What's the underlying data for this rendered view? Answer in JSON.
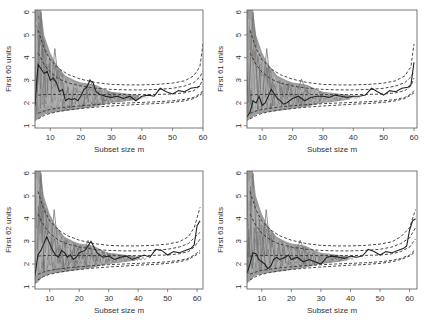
{
  "figure": {
    "width": 425,
    "height": 326,
    "layout": "2x2"
  },
  "colors": {
    "frame": "#555555",
    "band": "#8a8a8a",
    "band_light": "#b5b5b5",
    "highlight": "#222222",
    "envelope": "#333333"
  },
  "chart_data": [
    {
      "type": "line",
      "panel": "top-left",
      "title": "",
      "xlabel": "Subset size m",
      "ylabel": "First 60 units",
      "xlim": [
        5,
        60
      ],
      "ylim": [
        0.9,
        6.1
      ],
      "xticks": [
        10,
        20,
        30,
        40,
        50,
        60
      ],
      "yticks": [
        1,
        2,
        3,
        4,
        5,
        6
      ],
      "grid": false,
      "frame": {
        "left": 35,
        "right": 203,
        "top": 10,
        "bottom": 128
      },
      "envelopes": {
        "x": [
          6,
          8,
          10,
          13,
          16,
          20,
          25,
          30,
          35,
          40,
          45,
          50,
          54,
          57,
          59,
          60
        ],
        "upper_99": [
          5.2,
          4.4,
          3.9,
          3.5,
          3.25,
          3.05,
          2.9,
          2.82,
          2.8,
          2.8,
          2.82,
          2.88,
          2.98,
          3.2,
          3.6,
          4.6
        ],
        "upper_95": [
          4.2,
          3.7,
          3.35,
          3.05,
          2.88,
          2.75,
          2.65,
          2.6,
          2.58,
          2.58,
          2.6,
          2.65,
          2.75,
          2.9,
          3.15,
          3.4
        ],
        "median": [
          2.35,
          2.37,
          2.38,
          2.38,
          2.38,
          2.37,
          2.37,
          2.37,
          2.37,
          2.37,
          2.38,
          2.4,
          2.45,
          2.55,
          2.75,
          3.1
        ],
        "lower_05": [
          1.55,
          1.65,
          1.72,
          1.78,
          1.83,
          1.88,
          1.93,
          1.97,
          2.0,
          2.03,
          2.06,
          2.1,
          2.16,
          2.25,
          2.4,
          2.55
        ],
        "lower_01": [
          1.3,
          1.45,
          1.55,
          1.63,
          1.7,
          1.76,
          1.82,
          1.87,
          1.91,
          1.95,
          1.98,
          2.03,
          2.1,
          2.2,
          2.35,
          2.45
        ]
      },
      "band": {
        "x": [
          5,
          6,
          7,
          8,
          10,
          12,
          15,
          18,
          20,
          23,
          25,
          28,
          30,
          33,
          36,
          39
        ],
        "top": [
          6.1,
          6.1,
          6.1,
          5.0,
          4.2,
          3.7,
          3.2,
          3.0,
          2.9,
          2.85,
          2.8,
          2.6,
          2.5,
          2.45,
          2.4,
          2.35
        ],
        "bot": [
          1.2,
          1.3,
          1.4,
          1.5,
          1.55,
          1.6,
          1.65,
          1.7,
          1.75,
          1.8,
          1.85,
          1.95,
          2.0,
          2.05,
          2.1,
          2.15
        ]
      },
      "highlight": {
        "x": [
          5,
          6,
          7,
          8,
          9,
          10,
          11,
          12,
          13,
          14,
          15,
          16,
          17,
          18,
          19,
          20,
          21,
          22,
          23,
          24,
          25,
          26,
          28,
          30,
          32,
          34,
          36,
          38,
          40,
          42,
          44,
          46,
          48,
          50,
          52,
          54,
          56,
          58,
          59
        ],
        "y": [
          1.9,
          3.7,
          3.5,
          3.3,
          3.4,
          3.0,
          3.1,
          2.9,
          2.5,
          2.6,
          2.1,
          2.2,
          2.15,
          2.2,
          2.1,
          2.3,
          2.6,
          2.7,
          3.0,
          2.9,
          2.5,
          2.4,
          2.3,
          2.25,
          2.3,
          2.2,
          2.3,
          2.1,
          2.3,
          2.35,
          2.3,
          2.65,
          2.5,
          2.4,
          2.55,
          2.5,
          2.65,
          2.7,
          2.75
        ]
      }
    },
    {
      "type": "line",
      "panel": "top-right",
      "title": "",
      "xlabel": "Subset size m",
      "ylabel": "First 61 units",
      "xlim": [
        5,
        61
      ],
      "ylim": [
        0.9,
        6.1
      ],
      "xticks": [
        10,
        20,
        30,
        40,
        50,
        60
      ],
      "yticks": [
        1,
        2,
        3,
        4,
        5,
        6
      ],
      "grid": false,
      "frame": {
        "left": 247,
        "right": 417,
        "top": 10,
        "bottom": 128
      },
      "envelopes": {
        "x": [
          6,
          8,
          10,
          13,
          16,
          20,
          25,
          30,
          35,
          40,
          45,
          50,
          54,
          57,
          59,
          60
        ],
        "upper_99": [
          5.2,
          4.4,
          3.9,
          3.5,
          3.25,
          3.05,
          2.9,
          2.82,
          2.8,
          2.8,
          2.82,
          2.88,
          2.98,
          3.2,
          3.6,
          4.6
        ],
        "upper_95": [
          4.2,
          3.7,
          3.35,
          3.05,
          2.88,
          2.75,
          2.65,
          2.6,
          2.58,
          2.58,
          2.6,
          2.65,
          2.75,
          2.9,
          3.15,
          3.4
        ],
        "median": [
          2.35,
          2.37,
          2.38,
          2.38,
          2.38,
          2.37,
          2.37,
          2.37,
          2.37,
          2.37,
          2.38,
          2.4,
          2.45,
          2.55,
          2.75,
          3.1
        ],
        "lower_05": [
          1.55,
          1.65,
          1.72,
          1.78,
          1.83,
          1.88,
          1.93,
          1.97,
          2.0,
          2.03,
          2.06,
          2.1,
          2.16,
          2.25,
          2.4,
          2.55
        ],
        "lower_01": [
          1.3,
          1.45,
          1.55,
          1.63,
          1.7,
          1.76,
          1.82,
          1.87,
          1.91,
          1.95,
          1.98,
          2.03,
          2.1,
          2.2,
          2.35,
          2.45
        ]
      },
      "band": {
        "x": [
          5,
          6,
          7,
          8,
          10,
          12,
          15,
          18,
          20,
          23,
          25,
          28,
          30,
          33,
          36,
          39
        ],
        "top": [
          6.1,
          6.1,
          6.1,
          5.0,
          4.2,
          3.7,
          3.2,
          3.0,
          2.9,
          2.85,
          2.8,
          2.6,
          2.5,
          2.45,
          2.4,
          2.35
        ],
        "bot": [
          1.2,
          1.3,
          1.4,
          1.5,
          1.55,
          1.6,
          1.65,
          1.7,
          1.75,
          1.8,
          1.85,
          1.95,
          2.0,
          2.05,
          2.1,
          2.15
        ]
      },
      "highlight": {
        "x": [
          5,
          6,
          7,
          8,
          9,
          10,
          11,
          12,
          13,
          14,
          15,
          16,
          17,
          18,
          19,
          20,
          22,
          24,
          26,
          28,
          30,
          32,
          34,
          36,
          38,
          40,
          42,
          44,
          46,
          48,
          50,
          52,
          54,
          56,
          58,
          59,
          60
        ],
        "y": [
          1.4,
          1.6,
          2.1,
          2.0,
          2.3,
          1.9,
          2.0,
          2.3,
          2.6,
          2.4,
          2.2,
          2.1,
          1.95,
          2.0,
          2.1,
          2.2,
          2.3,
          2.1,
          2.25,
          2.3,
          2.3,
          2.25,
          2.35,
          2.3,
          2.25,
          2.3,
          2.3,
          2.35,
          2.65,
          2.5,
          2.35,
          2.55,
          2.5,
          2.65,
          2.7,
          2.8,
          3.8
        ]
      }
    },
    {
      "type": "line",
      "panel": "bottom-left",
      "title": "",
      "xlabel": "Subset size m",
      "ylabel": "First 62 units",
      "xlim": [
        5,
        62
      ],
      "ylim": [
        0.9,
        6.1
      ],
      "xticks": [
        10,
        20,
        30,
        40,
        50,
        60
      ],
      "yticks": [
        1,
        2,
        3,
        4,
        5,
        6
      ],
      "grid": false,
      "frame": {
        "left": 35,
        "right": 203,
        "top": 171,
        "bottom": 289
      },
      "envelopes": {
        "x": [
          6,
          8,
          10,
          13,
          16,
          20,
          25,
          30,
          35,
          40,
          45,
          50,
          54,
          57,
          59,
          61
        ],
        "upper_99": [
          5.2,
          4.4,
          3.9,
          3.5,
          3.25,
          3.05,
          2.9,
          2.82,
          2.8,
          2.8,
          2.82,
          2.88,
          2.98,
          3.2,
          3.6,
          4.5
        ],
        "upper_95": [
          4.2,
          3.7,
          3.35,
          3.05,
          2.88,
          2.75,
          2.65,
          2.6,
          2.58,
          2.58,
          2.6,
          2.65,
          2.75,
          2.9,
          3.15,
          3.4
        ],
        "median": [
          2.35,
          2.37,
          2.38,
          2.38,
          2.38,
          2.37,
          2.37,
          2.37,
          2.37,
          2.37,
          2.38,
          2.4,
          2.45,
          2.55,
          2.75,
          3.1
        ],
        "lower_05": [
          1.55,
          1.65,
          1.72,
          1.78,
          1.83,
          1.88,
          1.93,
          1.97,
          2.0,
          2.03,
          2.06,
          2.1,
          2.16,
          2.25,
          2.4,
          2.6
        ],
        "lower_01": [
          1.3,
          1.45,
          1.55,
          1.63,
          1.7,
          1.76,
          1.82,
          1.87,
          1.91,
          1.95,
          1.98,
          2.03,
          2.1,
          2.2,
          2.35,
          2.5
        ]
      },
      "band": {
        "x": [
          5,
          6,
          7,
          8,
          10,
          12,
          15,
          18,
          20,
          23,
          25,
          28,
          30,
          33,
          36,
          39
        ],
        "top": [
          6.1,
          6.1,
          6.1,
          5.0,
          4.2,
          3.7,
          3.2,
          3.0,
          2.9,
          2.85,
          2.8,
          2.6,
          2.5,
          2.45,
          2.4,
          2.35
        ],
        "bot": [
          1.1,
          1.2,
          1.35,
          1.45,
          1.55,
          1.6,
          1.65,
          1.7,
          1.75,
          1.8,
          1.85,
          1.95,
          2.0,
          2.05,
          2.1,
          2.15
        ]
      },
      "highlight": {
        "x": [
          5,
          6,
          7,
          8,
          9,
          10,
          11,
          12,
          13,
          14,
          15,
          16,
          17,
          18,
          19,
          20,
          22,
          24,
          26,
          28,
          30,
          32,
          34,
          36,
          38,
          40,
          42,
          44,
          46,
          48,
          50,
          52,
          54,
          56,
          58,
          59,
          60,
          61
        ],
        "y": [
          1.5,
          2.4,
          2.6,
          2.9,
          3.2,
          2.9,
          2.6,
          2.4,
          2.3,
          2.6,
          2.5,
          2.3,
          2.4,
          2.2,
          2.3,
          2.5,
          2.6,
          3.0,
          2.5,
          2.3,
          2.35,
          2.2,
          2.3,
          2.35,
          2.2,
          2.3,
          2.4,
          2.3,
          2.65,
          2.6,
          2.4,
          2.55,
          2.5,
          2.6,
          2.7,
          2.85,
          3.7,
          3.9
        ]
      }
    },
    {
      "type": "line",
      "panel": "bottom-right",
      "title": "",
      "xlabel": "Subset size m",
      "ylabel": "First 63 units",
      "xlim": [
        5,
        62.5
      ],
      "ylim": [
        0.9,
        6.1
      ],
      "xticks": [
        10,
        20,
        30,
        40,
        50,
        60
      ],
      "yticks": [
        1,
        2,
        3,
        4,
        5,
        6
      ],
      "grid": false,
      "frame": {
        "left": 247,
        "right": 417,
        "top": 171,
        "bottom": 289
      },
      "envelopes": {
        "x": [
          6,
          8,
          10,
          13,
          16,
          20,
          25,
          30,
          35,
          40,
          45,
          50,
          54,
          57,
          60,
          62
        ],
        "upper_99": [
          5.2,
          4.4,
          3.9,
          3.5,
          3.25,
          3.05,
          2.9,
          2.82,
          2.8,
          2.8,
          2.82,
          2.88,
          2.98,
          3.2,
          3.6,
          4.4
        ],
        "upper_95": [
          4.2,
          3.7,
          3.35,
          3.05,
          2.88,
          2.75,
          2.65,
          2.6,
          2.58,
          2.58,
          2.6,
          2.65,
          2.75,
          2.9,
          3.15,
          3.6
        ],
        "median": [
          2.35,
          2.37,
          2.38,
          2.38,
          2.38,
          2.37,
          2.37,
          2.37,
          2.37,
          2.37,
          2.38,
          2.4,
          2.45,
          2.55,
          2.75,
          3.1
        ],
        "lower_05": [
          1.55,
          1.65,
          1.72,
          1.78,
          1.83,
          1.88,
          1.93,
          1.97,
          2.0,
          2.03,
          2.06,
          2.1,
          2.16,
          2.25,
          2.4,
          2.65
        ],
        "lower_01": [
          1.3,
          1.45,
          1.55,
          1.63,
          1.7,
          1.76,
          1.82,
          1.87,
          1.91,
          1.95,
          1.98,
          2.03,
          2.1,
          2.2,
          2.35,
          2.55
        ]
      },
      "band": {
        "x": [
          5,
          6,
          7,
          8,
          10,
          12,
          15,
          18,
          20,
          23,
          25,
          28,
          30,
          33,
          36,
          39
        ],
        "top": [
          6.1,
          6.1,
          6.1,
          5.0,
          4.2,
          3.7,
          3.2,
          3.0,
          2.9,
          2.85,
          2.8,
          2.6,
          2.5,
          2.45,
          2.4,
          2.35
        ],
        "bot": [
          1.15,
          1.25,
          1.4,
          1.5,
          1.55,
          1.6,
          1.65,
          1.7,
          1.75,
          1.8,
          1.85,
          1.95,
          2.0,
          2.05,
          2.1,
          2.15
        ]
      },
      "highlight": {
        "x": [
          5,
          6,
          7,
          8,
          9,
          10,
          11,
          12,
          13,
          14,
          15,
          16,
          17,
          18,
          19,
          20,
          22,
          24,
          26,
          28,
          30,
          32,
          34,
          36,
          38,
          40,
          42,
          44,
          46,
          48,
          50,
          52,
          54,
          56,
          58,
          59,
          60,
          61,
          62
        ],
        "y": [
          1.6,
          2.0,
          2.5,
          2.45,
          2.2,
          2.1,
          2.0,
          1.8,
          1.9,
          2.2,
          2.3,
          2.2,
          2.25,
          2.3,
          2.4,
          2.2,
          2.3,
          2.1,
          2.2,
          2.1,
          2.0,
          2.3,
          2.35,
          2.3,
          2.25,
          2.35,
          2.3,
          2.35,
          2.65,
          2.55,
          2.4,
          2.55,
          2.5,
          2.6,
          2.7,
          2.8,
          3.5,
          3.9,
          4.0
        ]
      }
    }
  ]
}
